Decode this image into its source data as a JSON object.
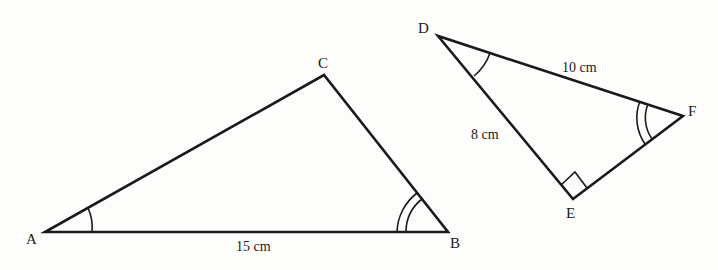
{
  "diagram": {
    "triangle_abc": {
      "vertices": {
        "A": "A",
        "B": "B",
        "C": "C"
      },
      "side_ab_label": "15 cm",
      "angle_marks": {
        "A": "single arc",
        "B": "double arc"
      }
    },
    "triangle_def": {
      "vertices": {
        "D": "D",
        "E": "E",
        "F": "F"
      },
      "side_df_label": "10 cm",
      "side_de_label": "8 cm",
      "angle_marks": {
        "D": "single arc",
        "F": "double arc",
        "E": "right angle"
      }
    },
    "colors": {
      "stroke": "#1a1a1a",
      "background": "#fdfdfb"
    }
  }
}
